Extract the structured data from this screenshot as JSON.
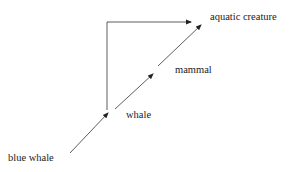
{
  "diagram": {
    "type": "hypernym-chain",
    "nodes": {
      "blue_whale": "blue whale",
      "whale": "whale",
      "mammal": "mammal",
      "aquatic_creature": "aquatic creature"
    },
    "edges": [
      {
        "from": "blue whale",
        "to": "whale"
      },
      {
        "from": "whale",
        "to": "mammal"
      },
      {
        "from": "mammal",
        "to": "aquatic creature"
      },
      {
        "from": "whale",
        "to": "aquatic creature",
        "style": "elbow"
      }
    ],
    "colors": {
      "line": "#222222",
      "background": "#ffffff"
    }
  }
}
